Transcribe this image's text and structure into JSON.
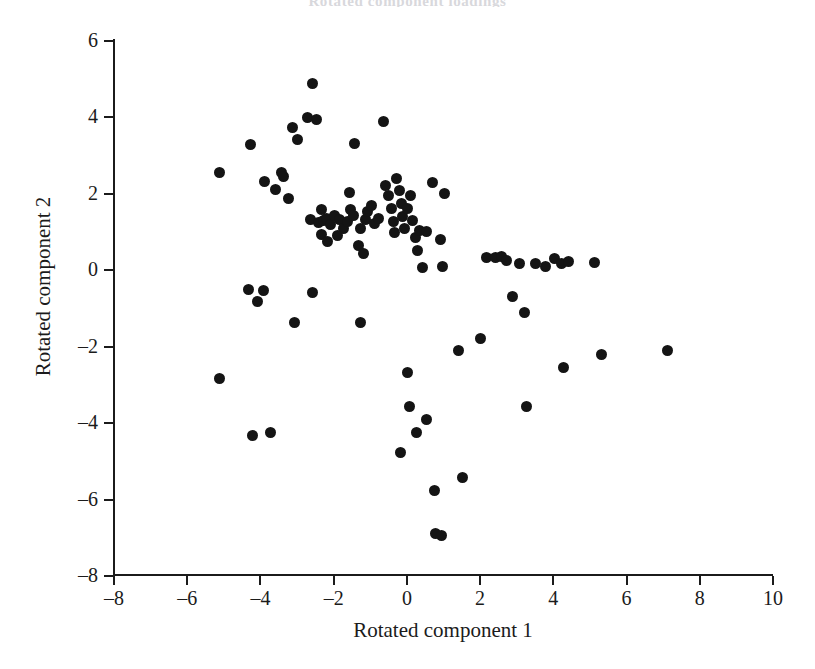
{
  "chart": {
    "type": "scatter",
    "title": "Rotated component loadings",
    "background_color": "#ffffff",
    "marker_color": "#141414",
    "axis_color": "#1b1b1b"
  },
  "axes": {
    "x_title": "Rotated component 1",
    "y_title": "Rotated component 2",
    "x_ticks": [
      -8,
      -6,
      -4,
      -2,
      0,
      2,
      4,
      6,
      8,
      10
    ],
    "y_ticks": [
      -8,
      -6,
      -4,
      -2,
      0,
      2,
      4,
      6
    ],
    "x_tick_labels": [
      "–8",
      "–6",
      "–4",
      "–2",
      "0",
      "2",
      "4",
      "6",
      "8",
      "10"
    ],
    "y_tick_labels": [
      "–8",
      "–6",
      "–4",
      "–2",
      "0",
      "2",
      "4",
      "6"
    ],
    "xlim": [
      -8,
      10
    ],
    "ylim": [
      -8,
      6
    ],
    "grid": false,
    "spines": [
      "left",
      "bottom"
    ],
    "tick_direction": "out"
  },
  "chart_data": {
    "type": "scatter",
    "title": "Rotated component loadings",
    "xlabel": "Rotated component 1",
    "ylabel": "Rotated component 2",
    "xlim": [
      -8,
      10
    ],
    "ylim": [
      -8,
      6
    ],
    "grid": false,
    "legend": null,
    "marker": "filled-circle",
    "n_points": 95,
    "points": [
      [
        -5.1,
        2.52
      ],
      [
        -5.1,
        -2.86
      ],
      [
        -4.25,
        3.26
      ],
      [
        -4.3,
        -0.52
      ],
      [
        -4.05,
        -0.85
      ],
      [
        -3.9,
        -0.55
      ],
      [
        -4.2,
        -4.35
      ],
      [
        -3.7,
        -4.28
      ],
      [
        -3.85,
        2.3
      ],
      [
        -3.55,
        2.08
      ],
      [
        -3.4,
        2.52
      ],
      [
        -3.35,
        2.44
      ],
      [
        -3.2,
        1.86
      ],
      [
        -3.1,
        3.72
      ],
      [
        -2.95,
        3.4
      ],
      [
        -2.7,
        3.96
      ],
      [
        -2.55,
        4.86
      ],
      [
        -2.45,
        3.92
      ],
      [
        -2.3,
        1.56
      ],
      [
        -3.05,
        -1.4
      ],
      [
        -2.55,
        -0.6
      ],
      [
        -2.6,
        1.3
      ],
      [
        -2.4,
        1.22
      ],
      [
        -2.25,
        1.28
      ],
      [
        -2.18,
        1.34
      ],
      [
        -2.05,
        1.18
      ],
      [
        -1.95,
        1.4
      ],
      [
        -1.8,
        1.3
      ],
      [
        -1.7,
        1.08
      ],
      [
        -2.3,
        0.92
      ],
      [
        -2.15,
        0.72
      ],
      [
        -1.88,
        0.88
      ],
      [
        -1.6,
        1.24
      ],
      [
        -1.55,
        2.0
      ],
      [
        -1.4,
        3.28
      ],
      [
        -1.5,
        1.56
      ],
      [
        -1.42,
        1.42
      ],
      [
        -1.25,
        1.06
      ],
      [
        -1.1,
        1.3
      ],
      [
        -1.05,
        1.52
      ],
      [
        -0.95,
        1.68
      ],
      [
        -0.85,
        1.2
      ],
      [
        -0.75,
        1.32
      ],
      [
        -1.3,
        0.62
      ],
      [
        -1.15,
        0.42
      ],
      [
        -1.25,
        -1.38
      ],
      [
        -0.62,
        3.88
      ],
      [
        -0.55,
        2.18
      ],
      [
        -0.48,
        1.92
      ],
      [
        -0.4,
        1.58
      ],
      [
        -0.35,
        1.26
      ],
      [
        -0.3,
        0.96
      ],
      [
        -0.25,
        2.38
      ],
      [
        -0.18,
        2.06
      ],
      [
        -0.12,
        1.72
      ],
      [
        -0.08,
        1.38
      ],
      [
        -0.05,
        1.08
      ],
      [
        0.05,
        1.58
      ],
      [
        0.12,
        1.92
      ],
      [
        0.18,
        1.28
      ],
      [
        0.25,
        0.84
      ],
      [
        0.32,
        0.48
      ],
      [
        0.38,
        1.02
      ],
      [
        0.45,
        0.04
      ],
      [
        0.55,
        1.0
      ],
      [
        0.72,
        2.26
      ],
      [
        1.05,
        1.98
      ],
      [
        0.95,
        0.78
      ],
      [
        1.0,
        0.06
      ],
      [
        0.05,
        -2.7
      ],
      [
        -0.15,
        -4.8
      ],
      [
        0.1,
        -3.58
      ],
      [
        0.3,
        -4.28
      ],
      [
        0.55,
        -3.92
      ],
      [
        0.78,
        -5.78
      ],
      [
        0.82,
        -6.92
      ],
      [
        0.98,
        -6.96
      ],
      [
        1.45,
        -2.12
      ],
      [
        1.55,
        -5.44
      ],
      [
        2.05,
        -1.82
      ],
      [
        2.2,
        0.32
      ],
      [
        2.45,
        0.3
      ],
      [
        2.62,
        0.34
      ],
      [
        2.75,
        0.22
      ],
      [
        2.9,
        -0.7
      ],
      [
        3.1,
        0.14
      ],
      [
        3.25,
        -1.12
      ],
      [
        3.3,
        -3.6
      ],
      [
        3.55,
        0.16
      ],
      [
        3.8,
        0.08
      ],
      [
        4.05,
        0.28
      ],
      [
        4.25,
        0.14
      ],
      [
        4.45,
        0.2
      ],
      [
        5.15,
        0.18
      ],
      [
        4.3,
        -2.58
      ],
      [
        5.35,
        -2.22
      ],
      [
        7.15,
        -2.12
      ]
    ]
  }
}
